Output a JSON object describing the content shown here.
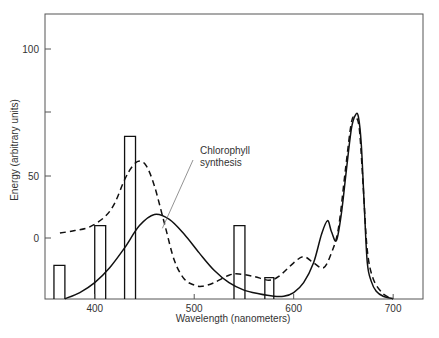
{
  "chart_data": {
    "type": "line",
    "title": "",
    "xlabel": "Wavelength (nanometers)",
    "ylabel": "Energy (arbitrary units)",
    "xlim": [
      350,
      730
    ],
    "ylim": [
      -49,
      128
    ],
    "grid": false,
    "legend": null,
    "x_ticks": [
      {
        "value": 400,
        "label": "400"
      },
      {
        "value": 500,
        "label": "500"
      },
      {
        "value": 600,
        "label": "600"
      },
      {
        "value": 700,
        "label": "700"
      }
    ],
    "y_ticks": [
      {
        "value": 0,
        "label": "0"
      },
      {
        "value": 50,
        "label": "50"
      },
      {
        "value": 75,
        "label": ""
      },
      {
        "value": 100,
        "label": "100"
      }
    ],
    "annotations": [
      {
        "text_lines": [
          "Chlorophyll",
          "synthesis"
        ],
        "x": 510,
        "y": 55,
        "points_to": {
          "x": 468,
          "y": 32
        },
        "target_series": "dashed"
      }
    ],
    "series": [
      {
        "name": "solid",
        "style": "solid",
        "x": [
          370,
          385,
          400,
          415,
          430,
          445,
          460,
          475,
          490,
          505,
          520,
          535,
          550,
          565,
          580,
          590,
          600,
          610,
          620,
          628,
          634,
          638,
          643,
          648,
          653,
          658,
          662,
          665,
          668,
          671,
          674,
          678,
          683,
          690,
          700
        ],
        "y": [
          -49,
          -44,
          -36,
          -24,
          -8,
          10,
          19,
          15,
          3,
          -12,
          -26,
          -36,
          -42,
          -45,
          -47,
          -47,
          -44,
          -36,
          -20,
          3,
          14,
          5,
          -2,
          20,
          55,
          88,
          99,
          98,
          75,
          25,
          -20,
          -35,
          -43,
          -47,
          -49
        ]
      },
      {
        "name": "dashed",
        "style": "dashed",
        "x": [
          365,
          380,
          395,
          410,
          420,
          430,
          438,
          445,
          452,
          460,
          470,
          480,
          490,
          500,
          508,
          520,
          535,
          545,
          560,
          575,
          585,
          600,
          610,
          620,
          630,
          638,
          645,
          652,
          658,
          662,
          666,
          670,
          674,
          680,
          690,
          700
        ],
        "y": [
          4,
          6,
          9,
          17,
          28,
          47,
          58,
          62,
          58,
          42,
          12,
          -18,
          -33,
          -38,
          -39,
          -36,
          -30,
          -29,
          -31,
          -34,
          -31,
          -20,
          -15,
          -20,
          -24,
          -12,
          8,
          55,
          93,
          97,
          88,
          40,
          -10,
          -33,
          -45,
          -49
        ]
      },
      {
        "name": "bars",
        "style": "bar",
        "bars": [
          {
            "x0": 359,
            "x1": 370,
            "value": -22
          },
          {
            "x0": 400,
            "x1": 411,
            "value": 10
          },
          {
            "x0": 430,
            "x1": 441,
            "value": 82
          },
          {
            "x0": 540,
            "x1": 551,
            "value": 10
          },
          {
            "x0": 571,
            "x1": 580,
            "value": -32
          }
        ]
      }
    ]
  }
}
